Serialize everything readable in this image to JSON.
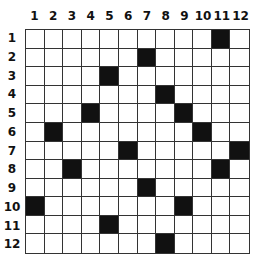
{
  "grid": {
    "rows": 12,
    "cols": 12,
    "column_labels": [
      "1",
      "2",
      "3",
      "4",
      "5",
      "6",
      "7",
      "8",
      "9",
      "10",
      "11",
      "12"
    ],
    "row_labels": [
      "1",
      "2",
      "3",
      "4",
      "5",
      "6",
      "7",
      "8",
      "9",
      "10",
      "11",
      "12"
    ],
    "black_cells": [
      {
        "row": 1,
        "col": 11
      },
      {
        "row": 2,
        "col": 7
      },
      {
        "row": 3,
        "col": 5
      },
      {
        "row": 4,
        "col": 8
      },
      {
        "row": 5,
        "col": 4
      },
      {
        "row": 5,
        "col": 9
      },
      {
        "row": 6,
        "col": 2
      },
      {
        "row": 6,
        "col": 10
      },
      {
        "row": 7,
        "col": 6
      },
      {
        "row": 7,
        "col": 12
      },
      {
        "row": 8,
        "col": 3
      },
      {
        "row": 8,
        "col": 11
      },
      {
        "row": 9,
        "col": 7
      },
      {
        "row": 10,
        "col": 1
      },
      {
        "row": 10,
        "col": 9
      },
      {
        "row": 11,
        "col": 5
      },
      {
        "row": 12,
        "col": 8
      }
    ],
    "colors": {
      "filled": "#111111",
      "empty": "#ffffff",
      "line": "#333333"
    }
  }
}
